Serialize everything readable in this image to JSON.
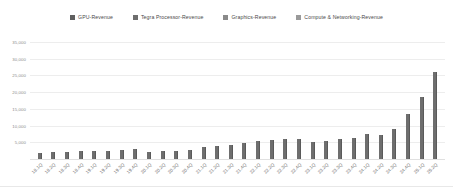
{
  "chart_data": {
    "type": "bar",
    "title": "",
    "xlabel": "",
    "ylabel": "",
    "ylim": [
      0,
      35000
    ],
    "yticks": [
      35000,
      30000,
      25000,
      20000,
      15000,
      10000,
      5000
    ],
    "ytick_labels": [
      "35,000",
      "30,000",
      "25,000",
      "20,000",
      "15,000",
      "10,000",
      "5,000"
    ],
    "grid": true,
    "legend_position": "top-center",
    "legend": [
      "GPU-Revenue",
      "Tegra Processor-Revenue",
      "Graphics-Revenue",
      "Compute & Networking-Revenue"
    ],
    "series_color": "#6e6e6e",
    "categories": [
      "18.1Q",
      "18.2Q",
      "18.3Q",
      "18.4Q",
      "19.1Q",
      "19.2Q",
      "19.3Q",
      "19.4Q",
      "20.1Q",
      "20.2Q",
      "20.3Q",
      "20.4Q",
      "21.1Q",
      "21.2Q",
      "21.3Q",
      "21.4Q",
      "22.1Q",
      "22.2Q",
      "22.3Q",
      "22.4Q",
      "23.1Q",
      "23.2Q",
      "23.3Q",
      "23.4Q",
      "24.1Q",
      "24.2Q",
      "24.3Q",
      "24.4Q",
      "25.1Q",
      "25.2Q"
    ],
    "series": [
      {
        "name": "Revenue",
        "values": [
          1900,
          2000,
          2100,
          2400,
          2300,
          2400,
          2600,
          2900,
          2200,
          2400,
          2500,
          2700,
          3500,
          4000,
          4300,
          4800,
          5300,
          5700,
          5900,
          6000,
          5000,
          5400,
          6100,
          6300,
          7600,
          7200,
          9000,
          13500,
          18500,
          26000
        ]
      }
    ],
    "max_value": 34000
  },
  "legend_items": [
    {
      "label": "GPU-Revenue",
      "color": "#5f5f5f"
    },
    {
      "label": "Tegra Processor-Revenue",
      "color": "#6e6e6e"
    },
    {
      "label": "Graphics-Revenue",
      "color": "#8a8a8a"
    },
    {
      "label": "Compute & Networking-Revenue",
      "color": "#9a9a9a"
    }
  ]
}
